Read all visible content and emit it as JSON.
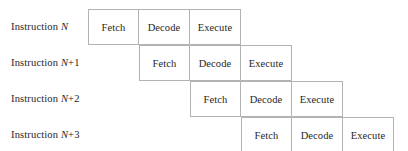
{
  "diagram": {
    "type": "pipeline-stagger",
    "stage_names": [
      "Fetch",
      "Decode",
      "Execute"
    ],
    "grid": {
      "origin_x": 88,
      "origin_y": 9,
      "col_width": 51,
      "row_height": 36,
      "border_color": "#b3b3b3",
      "background": "#ffffff",
      "text_color": "#262626"
    },
    "rows": [
      {
        "label_prefix": "Instruction ",
        "label_var": "N",
        "label_suffix": "",
        "start_col": 0,
        "cells": [
          {
            "stage": "Fetch"
          },
          {
            "stage": "Decode"
          },
          {
            "stage": "Execute"
          }
        ]
      },
      {
        "label_prefix": "Instruction ",
        "label_var": "N",
        "label_suffix": "+1",
        "start_col": 1,
        "cells": [
          {
            "stage": "Fetch"
          },
          {
            "stage": "Decode"
          },
          {
            "stage": "Execute"
          }
        ]
      },
      {
        "label_prefix": "Instruction ",
        "label_var": "N",
        "label_suffix": "+2",
        "start_col": 2,
        "cells": [
          {
            "stage": "Fetch"
          },
          {
            "stage": "Decode"
          },
          {
            "stage": "Execute"
          }
        ]
      },
      {
        "label_prefix": "Instruction ",
        "label_var": "N",
        "label_suffix": "+3",
        "start_col": 3,
        "cells": [
          {
            "stage": "Fetch"
          },
          {
            "stage": "Decode"
          },
          {
            "stage": "Execute"
          }
        ]
      }
    ]
  }
}
